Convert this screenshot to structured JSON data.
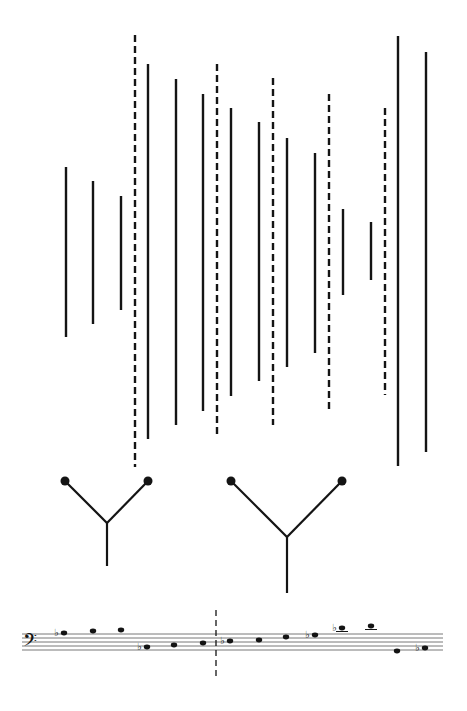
{
  "colors": {
    "ink": "#141414",
    "staff": "#555555",
    "background": "#ffffff"
  },
  "vertical_lines": [
    {
      "x": 66,
      "y1": 167,
      "y2": 337,
      "style": "solid"
    },
    {
      "x": 93,
      "y1": 181,
      "y2": 324,
      "style": "solid"
    },
    {
      "x": 121,
      "y1": 196,
      "y2": 310,
      "style": "solid"
    },
    {
      "x": 135,
      "y1": 35,
      "y2": 467,
      "style": "dashed"
    },
    {
      "x": 148,
      "y1": 64,
      "y2": 439,
      "style": "solid"
    },
    {
      "x": 176,
      "y1": 79,
      "y2": 425,
      "style": "solid"
    },
    {
      "x": 203,
      "y1": 94,
      "y2": 411,
      "style": "solid"
    },
    {
      "x": 217,
      "y1": 64,
      "y2": 438,
      "style": "dashed"
    },
    {
      "x": 231,
      "y1": 108,
      "y2": 396,
      "style": "solid"
    },
    {
      "x": 259,
      "y1": 122,
      "y2": 381,
      "style": "solid"
    },
    {
      "x": 273,
      "y1": 78,
      "y2": 425,
      "style": "dashed"
    },
    {
      "x": 287,
      "y1": 138,
      "y2": 367,
      "style": "solid"
    },
    {
      "x": 315,
      "y1": 153,
      "y2": 353,
      "style": "solid"
    },
    {
      "x": 329,
      "y1": 94,
      "y2": 410,
      "style": "dashed"
    },
    {
      "x": 343,
      "y1": 209,
      "y2": 295,
      "style": "solid"
    },
    {
      "x": 371,
      "y1": 222,
      "y2": 280,
      "style": "solid"
    },
    {
      "x": 385,
      "y1": 108,
      "y2": 395,
      "style": "dashed"
    },
    {
      "x": 398,
      "y1": 36,
      "y2": 466,
      "style": "solid"
    },
    {
      "x": 426,
      "y1": 52,
      "y2": 452,
      "style": "solid"
    }
  ],
  "y_shapes": [
    {
      "left": [
        65,
        481
      ],
      "right": [
        148,
        481
      ],
      "junction": [
        107,
        523
      ],
      "stem_end": [
        107,
        566
      ]
    },
    {
      "left": [
        231,
        481
      ],
      "right": [
        342,
        481
      ],
      "junction": [
        287,
        537
      ],
      "stem_end": [
        287,
        593
      ]
    }
  ],
  "staff": {
    "clef": "bass-clef",
    "clef_glyph": "𝄢",
    "x1": 22,
    "x2": 443,
    "lines_y": [
      634,
      638,
      642,
      646,
      650
    ],
    "barline": {
      "x": 216,
      "y1": 610,
      "y2": 678,
      "style": "dashed"
    },
    "notes": [
      {
        "x": 64,
        "y": 633,
        "flat": true,
        "ledger": false
      },
      {
        "x": 93,
        "y": 631,
        "flat": false,
        "ledger": false
      },
      {
        "x": 121,
        "y": 630,
        "flat": false,
        "ledger": false
      },
      {
        "x": 147,
        "y": 647,
        "flat": true,
        "ledger": false
      },
      {
        "x": 174,
        "y": 645,
        "flat": false,
        "ledger": false
      },
      {
        "x": 203,
        "y": 643,
        "flat": false,
        "ledger": false
      },
      {
        "x": 230,
        "y": 641,
        "flat": true,
        "ledger": false
      },
      {
        "x": 259,
        "y": 640,
        "flat": false,
        "ledger": false
      },
      {
        "x": 286,
        "y": 637,
        "flat": false,
        "ledger": false
      },
      {
        "x": 315,
        "y": 635,
        "flat": true,
        "ledger": false
      },
      {
        "x": 342,
        "y": 628,
        "flat": true,
        "ledger": true
      },
      {
        "x": 371,
        "y": 626,
        "flat": false,
        "ledger": true
      },
      {
        "x": 397,
        "y": 651,
        "flat": false,
        "ledger": false
      },
      {
        "x": 425,
        "y": 648,
        "flat": true,
        "ledger": false
      }
    ],
    "flat_glyph": "♭"
  }
}
